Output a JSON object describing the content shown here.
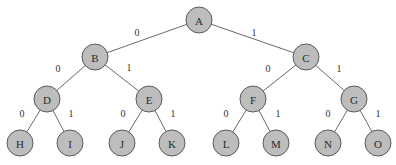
{
  "diagram": {
    "type": "binary-tree",
    "node_radius": 13,
    "colors": {
      "node_fill": "#bdbdbd",
      "node_stroke": "#5a5a5a",
      "edge": "#6a6a6a",
      "text": "#2a2a2a"
    },
    "nodes": [
      {
        "id": "A",
        "label": "A",
        "x": 199,
        "y": 20
      },
      {
        "id": "B",
        "label": "B",
        "x": 95,
        "y": 57
      },
      {
        "id": "C",
        "label": "C",
        "x": 306,
        "y": 57
      },
      {
        "id": "D",
        "label": "D",
        "x": 47,
        "y": 99
      },
      {
        "id": "E",
        "label": "E",
        "x": 149,
        "y": 99
      },
      {
        "id": "F",
        "label": "F",
        "x": 253,
        "y": 99
      },
      {
        "id": "G",
        "label": "G",
        "x": 354,
        "y": 99
      },
      {
        "id": "H",
        "label": "H",
        "x": 20,
        "y": 143
      },
      {
        "id": "I",
        "label": "I",
        "x": 70,
        "y": 143
      },
      {
        "id": "J",
        "label": "J",
        "x": 122,
        "y": 143
      },
      {
        "id": "K",
        "label": "K",
        "x": 172,
        "y": 143
      },
      {
        "id": "L",
        "label": "L",
        "x": 226,
        "y": 143
      },
      {
        "id": "M",
        "label": "M",
        "x": 276,
        "y": 143
      },
      {
        "id": "N",
        "label": "N",
        "x": 328,
        "y": 143
      },
      {
        "id": "O",
        "label": "O",
        "x": 378,
        "y": 143
      }
    ],
    "edges": [
      {
        "from": "A",
        "to": "B",
        "label": "0",
        "lx": 137,
        "ly": 32
      },
      {
        "from": "A",
        "to": "C",
        "label": "1",
        "lx": 254,
        "ly": 32
      },
      {
        "from": "B",
        "to": "D",
        "label": "0",
        "lx": 58,
        "ly": 68
      },
      {
        "from": "B",
        "to": "E",
        "label": "1",
        "lx": 129,
        "ly": 67
      },
      {
        "from": "C",
        "to": "F",
        "label": "0",
        "lx": 268,
        "ly": 68
      },
      {
        "from": "C",
        "to": "G",
        "label": "1",
        "lx": 339,
        "ly": 68
      },
      {
        "from": "D",
        "to": "H",
        "label": "0",
        "lx": 22,
        "ly": 113
      },
      {
        "from": "D",
        "to": "I",
        "label": "1",
        "lx": 71,
        "ly": 113
      },
      {
        "from": "E",
        "to": "J",
        "label": "0",
        "lx": 123,
        "ly": 113
      },
      {
        "from": "E",
        "to": "K",
        "label": "1",
        "lx": 173,
        "ly": 113
      },
      {
        "from": "F",
        "to": "L",
        "label": "0",
        "lx": 226,
        "ly": 113
      },
      {
        "from": "F",
        "to": "M",
        "label": "1",
        "lx": 278,
        "ly": 113
      },
      {
        "from": "G",
        "to": "N",
        "label": "0",
        "lx": 328,
        "ly": 113
      },
      {
        "from": "G",
        "to": "O",
        "label": "1",
        "lx": 378,
        "ly": 113
      }
    ]
  }
}
